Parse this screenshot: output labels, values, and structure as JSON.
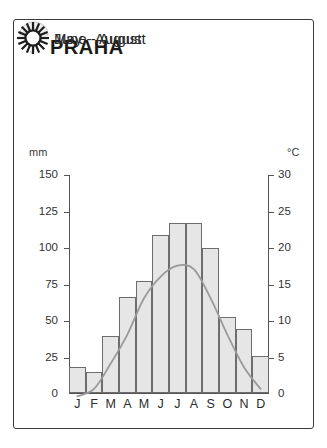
{
  "card": {
    "title": "PRAHA"
  },
  "legend": [
    {
      "icon": "umbrella-icon",
      "label": "June - August",
      "name": "legend-rain"
    },
    {
      "icon": "sun-icon",
      "label": "May - August",
      "name": "legend-sun"
    }
  ],
  "axes": {
    "left_unit": "mm",
    "right_unit": "°C",
    "left_ticks": [
      "150",
      "125",
      "100",
      "75",
      "50",
      "25",
      "0"
    ],
    "right_ticks": [
      "30",
      "25",
      "20",
      "15",
      "10",
      "5",
      "0"
    ]
  },
  "colors": {
    "bar_fill": "#e6e6e6",
    "bar_stroke": "#6d6d6d",
    "temp_line": "#9a9a9a",
    "border": "#3a3a3a",
    "text": "#1a1a1a"
  },
  "chart_data": {
    "type": "bar",
    "title": "PRAHA",
    "categories": [
      "J",
      "F",
      "M",
      "A",
      "M",
      "J",
      "J",
      "A",
      "S",
      "O",
      "N",
      "D"
    ],
    "month_names": [
      "January",
      "February",
      "March",
      "April",
      "May",
      "June",
      "July",
      "August",
      "September",
      "October",
      "November",
      "December"
    ],
    "series": [
      {
        "name": "Precipitation",
        "kind": "bar",
        "unit": "mm",
        "axis": "left",
        "values": [
          18,
          14,
          39,
          66,
          77,
          109,
          117,
          117,
          100,
          52,
          44,
          25
        ]
      },
      {
        "name": "Temperature",
        "kind": "line",
        "unit": "°C",
        "axis": "right",
        "values": [
          -0.5,
          0.5,
          4,
          8,
          13,
          16,
          17.5,
          17,
          13,
          8,
          3.5,
          0.5
        ]
      }
    ],
    "xlabel": "",
    "ylabel": "mm",
    "y2label": "°C",
    "ylim": [
      0,
      150
    ],
    "y2lim": [
      0,
      30
    ],
    "grid": false,
    "legend_position": "top-left"
  }
}
